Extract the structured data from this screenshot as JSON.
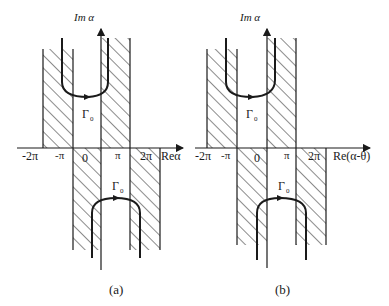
{
  "panels": [
    {
      "id": "a",
      "caption": "(a)",
      "vertical_axis_label": "Im α",
      "horizontal_axis_label": "Reα",
      "tick_labels": [
        "-2π",
        "-π",
        "0",
        "π",
        "2π"
      ],
      "upper_contour_label": "Γ",
      "upper_contour_subscript": "0",
      "lower_contour_label": "Γ",
      "lower_contour_subscript": "0"
    },
    {
      "id": "b",
      "caption": "(b)",
      "vertical_axis_label": "Im α",
      "horizontal_axis_label": "Re(α-θ)",
      "tick_labels": [
        "-2π",
        "-π",
        "0",
        "π",
        "2π"
      ],
      "upper_contour_label": "Γ",
      "upper_contour_subscript": "0",
      "lower_contour_label": "Γ",
      "lower_contour_subscript": "0"
    }
  ],
  "colors": {
    "ink": "#1a1a1a",
    "background": "#ffffff"
  }
}
